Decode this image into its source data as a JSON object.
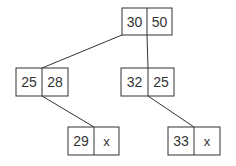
{
  "diagram": {
    "type": "tree",
    "nodes": [
      {
        "id": "root",
        "keys": [
          "30",
          "50"
        ],
        "x": 122,
        "y": 8,
        "w": 50,
        "h": 27
      },
      {
        "id": "left",
        "keys": [
          "25",
          "28"
        ],
        "x": 16,
        "y": 68,
        "w": 52,
        "h": 28
      },
      {
        "id": "right",
        "keys": [
          "32",
          "25"
        ],
        "x": 121,
        "y": 68,
        "w": 53,
        "h": 28
      },
      {
        "id": "left-child",
        "keys": [
          "29",
          "x"
        ],
        "x": 68,
        "y": 127,
        "w": 51,
        "h": 28
      },
      {
        "id": "right-child",
        "keys": [
          "33",
          "x"
        ],
        "x": 168,
        "y": 127,
        "w": 52,
        "h": 28
      }
    ],
    "edges": [
      {
        "from": "root",
        "to": "left"
      },
      {
        "from": "root",
        "to": "right"
      },
      {
        "from": "left",
        "to": "left-child"
      },
      {
        "from": "right",
        "to": "right-child"
      }
    ],
    "colors": {
      "stroke": "#333333",
      "background": "#ffffff"
    }
  }
}
